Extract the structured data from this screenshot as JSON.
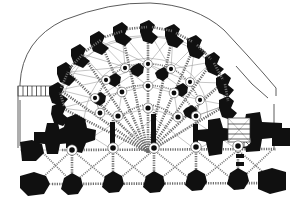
{
  "drawing": {
    "title": "Gothic chevet vaulting plan",
    "subject": "apse-chapel-rib-vault-plan",
    "technique": "line-engraving",
    "orientation": "apse-at-top",
    "scale_note": "",
    "colors": {
      "background": "#ffffff",
      "masonry_black": "#101010",
      "outer_wall_line": "#4a4a4a",
      "rib_grey": "#6b6b6b",
      "diagonal_rib_grey": "#7a7a7a",
      "hairline_grey": "#8d8d8d",
      "boss_core": "#0d0d0d"
    },
    "legend_visible": false,
    "labels_visible": false
  },
  "chart_data": {
    "type": "diagram",
    "xlabel": "",
    "ylabel": "",
    "viewbox": [
      0,
      0,
      290,
      212
    ],
    "outer_wall": {
      "name": "apse-outer-wall-contour",
      "path": "M 20 96 L 20 84 Q 22 40 64 20 Q 110 2 150 3 Q 196 5 224 30 L 248 56 L 264 74 L 276 88 L 276 96",
      "stroke": "#4a4a4a",
      "width": 0.9
    },
    "left_return_wall": {
      "name": "left-aisle-wall",
      "path": "M 20 96 L 20 132",
      "stroke": "#4a4a4a"
    },
    "west_stair_block": {
      "name": "west-stair-hatch",
      "x": 18,
      "y": 86,
      "w": 34,
      "h": 10,
      "treads": 7
    },
    "ambulatory_radius": {
      "outer": 96,
      "middle": 70,
      "inner": 44,
      "center_x": 148,
      "center_y": 156
    },
    "radiating_chapel_piers": [
      {
        "id": "p1",
        "x": 60,
        "y": 113,
        "angle": 198,
        "size": 13
      },
      {
        "id": "p2",
        "x": 57,
        "y": 95,
        "angle": 210,
        "size": 13
      },
      {
        "id": "p3",
        "x": 64,
        "y": 76,
        "angle": 222,
        "size": 13
      },
      {
        "id": "p4",
        "x": 78,
        "y": 58,
        "angle": 236,
        "size": 13
      },
      {
        "id": "p5",
        "x": 97,
        "y": 44,
        "angle": 250,
        "size": 13
      },
      {
        "id": "p6",
        "x": 120,
        "y": 35,
        "angle": 264,
        "size": 13
      },
      {
        "id": "p7",
        "x": 146,
        "y": 32,
        "angle": 278,
        "size": 13
      },
      {
        "id": "p8",
        "x": 171,
        "y": 36,
        "angle": 292,
        "size": 13
      },
      {
        "id": "p9",
        "x": 194,
        "y": 47,
        "angle": 306,
        "size": 13
      },
      {
        "id": "p10",
        "x": 211,
        "y": 64,
        "angle": 320,
        "size": 13
      },
      {
        "id": "p11",
        "x": 222,
        "y": 85,
        "angle": 334,
        "size": 13
      },
      {
        "id": "p12",
        "x": 226,
        "y": 107,
        "angle": 348,
        "size": 13
      }
    ],
    "arcade_piers": [
      {
        "id": "a1",
        "x": 100,
        "y": 101,
        "size": 6
      },
      {
        "id": "a2",
        "x": 115,
        "y": 82,
        "size": 6
      },
      {
        "id": "a3",
        "x": 138,
        "y": 72,
        "size": 6
      },
      {
        "id": "a4",
        "x": 163,
        "y": 76,
        "size": 6
      },
      {
        "id": "a5",
        "x": 182,
        "y": 92,
        "size": 6
      },
      {
        "id": "a6",
        "x": 191,
        "y": 114,
        "size": 6
      }
    ],
    "crossing_piers": [
      {
        "id": "c-left-upper",
        "x": 76,
        "y": 122,
        "w": 22,
        "h": 22,
        "type": "compound-cross"
      },
      {
        "id": "c-left-outer",
        "x": 30,
        "y": 138,
        "w": 26,
        "h": 24,
        "type": "compound-cross"
      },
      {
        "id": "c-right-upper",
        "x": 213,
        "y": 124,
        "w": 18,
        "h": 30,
        "type": "compound-L"
      },
      {
        "id": "c-right-outer",
        "x": 246,
        "y": 118,
        "w": 36,
        "h": 30,
        "type": "compound-T"
      }
    ],
    "nave_bay_piers": [
      {
        "id": "n1",
        "x": 72,
        "y": 186,
        "size": 9
      },
      {
        "id": "n2",
        "x": 113,
        "y": 184,
        "size": 9
      },
      {
        "id": "n3",
        "x": 154,
        "y": 184,
        "size": 9
      },
      {
        "id": "n4",
        "x": 196,
        "y": 182,
        "size": 9
      },
      {
        "id": "n5",
        "x": 238,
        "y": 181,
        "size": 9
      },
      {
        "id": "n6",
        "x": 268,
        "y": 185,
        "size": 11
      }
    ],
    "vault_bosses": [
      {
        "x": 148,
        "y": 64,
        "r": 2.6
      },
      {
        "x": 125,
        "y": 68,
        "r": 2.6
      },
      {
        "x": 171,
        "y": 69,
        "r": 2.6
      },
      {
        "x": 106,
        "y": 80,
        "r": 2.6
      },
      {
        "x": 190,
        "y": 82,
        "r": 2.6
      },
      {
        "x": 95,
        "y": 98,
        "r": 2.6
      },
      {
        "x": 200,
        "y": 100,
        "r": 2.6
      },
      {
        "x": 148,
        "y": 86,
        "r": 3.0
      },
      {
        "x": 122,
        "y": 92,
        "r": 3.0
      },
      {
        "x": 174,
        "y": 93,
        "r": 3.0
      },
      {
        "x": 100,
        "y": 113,
        "r": 3.0
      },
      {
        "x": 196,
        "y": 116,
        "r": 3.0
      },
      {
        "x": 148,
        "y": 108,
        "r": 3.2
      },
      {
        "x": 118,
        "y": 116,
        "r": 3.2
      },
      {
        "x": 178,
        "y": 117,
        "r": 3.2
      },
      {
        "x": 113,
        "y": 148,
        "r": 3.4
      },
      {
        "x": 154,
        "y": 148,
        "r": 3.4
      },
      {
        "x": 196,
        "y": 147,
        "r": 3.4
      },
      {
        "x": 238,
        "y": 146,
        "r": 3.4
      },
      {
        "x": 72,
        "y": 150,
        "r": 3.4
      }
    ],
    "spiral_stair": {
      "name": "spiral-staircase",
      "cx": 244,
      "cy": 140,
      "r": 7,
      "newel_r": 2.2,
      "treads": 9
    },
    "bay_grid": {
      "transverse_ribs_y": [
        150,
        184
      ],
      "transverse_ribs_x": [
        72,
        113,
        154,
        196,
        238,
        268
      ],
      "diagonal_crossings": 4
    },
    "rib_count_radiating": 12,
    "grid": false,
    "legend": []
  }
}
